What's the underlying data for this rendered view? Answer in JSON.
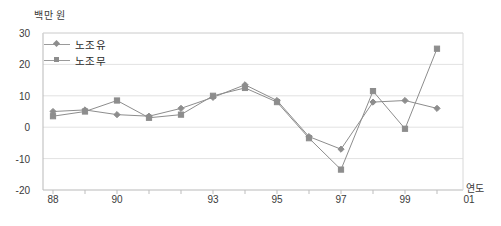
{
  "chart_data": {
    "type": "line",
    "title": "",
    "xlabel": "연도",
    "ylabel": "백만 원",
    "ylim": [
      -20,
      30
    ],
    "yticks": [
      30,
      20,
      10,
      0,
      -10,
      -20
    ],
    "grid": true,
    "legend_position": "top-left",
    "categories": [
      "88",
      "89",
      "90",
      "91",
      "92",
      "93",
      "94",
      "95",
      "96",
      "97",
      "98",
      "99",
      "00",
      "01"
    ],
    "xtick_labels": [
      "88",
      "90",
      "93",
      "95",
      "97",
      "99",
      "01"
    ],
    "series": [
      {
        "name": "노조유",
        "marker": "diamond",
        "color": "#8d8d8d",
        "values": [
          5,
          5.5,
          4,
          3.5,
          6,
          9.5,
          13.5,
          8.5,
          -3,
          -7,
          8,
          8.5,
          6,
          null
        ]
      },
      {
        "name": "노조무",
        "marker": "square",
        "color": "#8d8d8d",
        "values": [
          3.5,
          5,
          8.5,
          3,
          4,
          10,
          12.5,
          8,
          -3.5,
          -13.5,
          11.5,
          -0.5,
          25,
          null
        ]
      }
    ]
  },
  "axis": {
    "unit_label": "백만 원",
    "x_axis_title": "연도"
  }
}
